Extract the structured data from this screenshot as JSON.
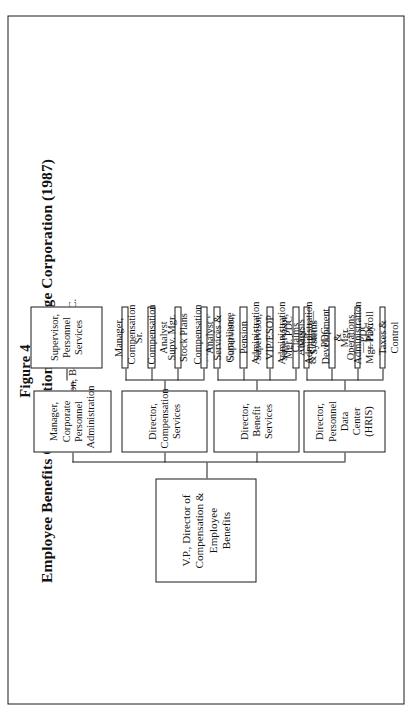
{
  "figure": {
    "number": "Figure 4",
    "title": "Employee Benefits Organization in a Large Corporation (1987)",
    "subtitle": "Compensation, Benefits & P.D.C."
  },
  "colors": {
    "ink": "#1a1a1a",
    "paper": "#ffffff"
  },
  "chart_data": {
    "type": "diagram",
    "diagram_kind": "organization-chart",
    "orientation": "rotated-90-ccw-on-page",
    "root": {
      "id": "vp",
      "label": "V.P., Director of Compensation & Employee Benefits",
      "lines": [
        "V.P., Director of",
        "Compensation & Employee",
        "Benefits"
      ]
    },
    "branches": [
      {
        "id": "pdc",
        "label": "Director, Personnel Data Center (HRIS)",
        "lines": [
          "Director, Personnel Data",
          "Center (HRIS)"
        ],
        "children": [
          {
            "id": "pdc-1",
            "label": "Mgr. PDC Analysis & Control—PDC",
            "lines": [
              "Mgr. PDC Analysis",
              "& Control—PDC"
            ]
          },
          {
            "id": "pdc-2",
            "label": "Mgr. Systems Development & Operations—PDC",
            "lines": [
              "Mgr. Systems Development",
              "& Operations—PDC"
            ]
          },
          {
            "id": "pdc-3",
            "label": "Mgr. Administration—PDC",
            "lines": [
              "Mgr.",
              "Administration—PDC"
            ]
          },
          {
            "id": "pdc-4",
            "label": "Mgr. Payroll Taxes & Control",
            "lines": [
              "Mgr. Payroll Taxes &",
              "Control"
            ]
          }
        ]
      },
      {
        "id": "benefit",
        "label": "Director, Benefit Services",
        "lines": [
          "Director, Benefit",
          "Services"
        ],
        "children": [
          {
            "id": "ben-1",
            "label": "Mgr. Group Services & Compliance",
            "lines": [
              "Mgr. Group Services &",
              "Compliance"
            ]
          },
          {
            "id": "ben-2",
            "label": "Supervisor, Pension Administration",
            "lines": [
              "Supervisor,",
              "Pension Administration"
            ]
          },
          {
            "id": "ben-3",
            "label": "Supervisor, VIP/ESOP Administration",
            "lines": [
              "Supervisor,",
              "VIP/ESOP Administration"
            ]
          },
          {
            "id": "ben-4",
            "label": "Supervisor, Claims Administration",
            "lines": [
              "Supervisor, Claims",
              "Administration"
            ]
          }
        ]
      },
      {
        "id": "comp",
        "label": "Director, Compensation Services",
        "lines": [
          "Director, Compensation",
          "Services"
        ],
        "children": [
          {
            "id": "comp-1",
            "label": "Manager, Compensation",
            "lines": [
              "Manager, Compensation"
            ]
          },
          {
            "id": "comp-2",
            "label": "Sr. Compensation Analyst",
            "lines": [
              "Sr. Compensation Analyst"
            ]
          },
          {
            "id": "comp-3",
            "label": "Supv. Mgr. Stock Plans",
            "lines": [
              "Supv. Mgr. Stock Plans"
            ]
          },
          {
            "id": "comp-4",
            "label": "Compensation Analyst",
            "lines": [
              "Compensation Analyst"
            ]
          }
        ]
      },
      {
        "id": "corp",
        "label": "Manager, Corporate Personnel Administration",
        "lines": [
          "Manager, Corporate",
          "Personnel Administration"
        ],
        "children": [
          {
            "id": "corp-1",
            "label": "Supervisor, Personnel Services",
            "lines": [
              "Supervisor, Personnel",
              "Services"
            ]
          }
        ]
      }
    ]
  }
}
